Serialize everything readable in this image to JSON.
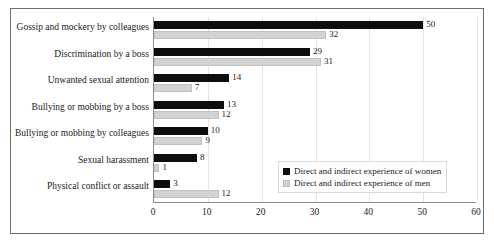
{
  "chart_data": {
    "type": "bar",
    "orientation": "horizontal",
    "title": "",
    "xlabel": "",
    "ylabel": "",
    "xlim": [
      0,
      60
    ],
    "xticks": [
      0,
      10,
      20,
      30,
      40,
      50,
      60
    ],
    "grid": true,
    "legend_position": "inside-lower-right",
    "categories": [
      "Gossip and mockery by colleagues",
      "Discrimination by a boss",
      "Unwanted sexual attention",
      "Bullying or mobbing by a boss",
      "Bullying or mobbing by colleagues",
      "Sexual harassment",
      "Physical conflict or assault"
    ],
    "series": [
      {
        "name": "Direct and indirect experience of women",
        "color": "#0d0d0d",
        "values": [
          50,
          29,
          14,
          13,
          10,
          8,
          3
        ]
      },
      {
        "name": "Direct and indirect experience of men",
        "color": "#d2d2d2",
        "values": [
          32,
          31,
          7,
          12,
          9,
          1,
          12
        ]
      }
    ]
  },
  "legend": {
    "items": [
      {
        "label": "Direct and indirect experience of women",
        "swatch": "black-square-swatch"
      },
      {
        "label": "Direct and indirect experience of men",
        "swatch": "gray-square-swatch"
      }
    ]
  }
}
